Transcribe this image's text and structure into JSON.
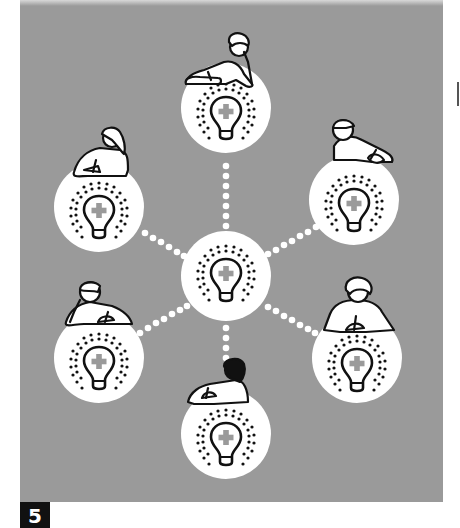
{
  "figure": {
    "label": "5",
    "colors": {
      "background": "#9a9a9a",
      "node_fill": "#ffffff",
      "line": "#111111",
      "plus": "#9a9a9a",
      "label_bg": "#111111"
    },
    "center_node": {
      "icon": "lightbulb-plus-icon"
    },
    "outer_nodes": [
      {
        "position": "top",
        "person": "thinking-person-hand-on-cheek"
      },
      {
        "position": "upper-left",
        "person": "writing-person-hair-bun"
      },
      {
        "position": "upper-right",
        "person": "writing-person-cap"
      },
      {
        "position": "lower-left",
        "person": "thinking-person-short-hair"
      },
      {
        "position": "lower-right",
        "person": "writing-person-curly-hair"
      },
      {
        "position": "bottom",
        "person": "writing-person-dark-hair"
      }
    ]
  }
}
